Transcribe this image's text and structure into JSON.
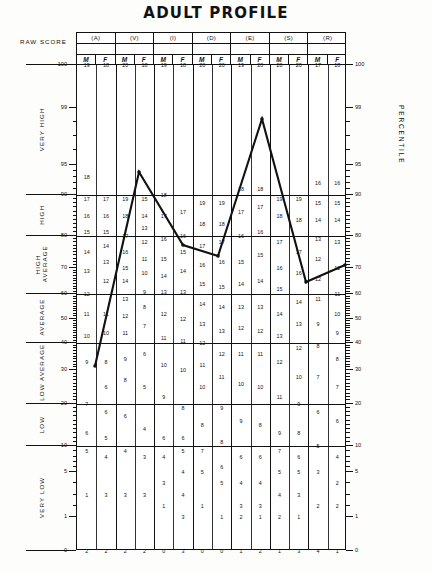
{
  "page": {
    "title": "ADULT PROFILE",
    "raw_score_label": "RAW SCORE",
    "percentile_label": "PERCENTILE"
  },
  "columns": [
    {
      "key": "A",
      "header": "(A)",
      "raw_score": "",
      "sub": [
        "M",
        "F"
      ]
    },
    {
      "key": "V",
      "header": "(V)",
      "raw_score": "",
      "sub": [
        "M",
        "F"
      ]
    },
    {
      "key": "I",
      "header": "(I)",
      "raw_score": "",
      "sub": [
        "M",
        "F"
      ]
    },
    {
      "key": "D",
      "header": "(D)",
      "raw_score": "",
      "sub": [
        "M",
        "F"
      ]
    },
    {
      "key": "E",
      "header": "(E)",
      "raw_score": "",
      "sub": [
        "M",
        "F"
      ]
    },
    {
      "key": "S",
      "header": "(S)",
      "raw_score": "",
      "sub": [
        "M",
        "F"
      ]
    },
    {
      "key": "R",
      "header": "(R)",
      "raw_score": "",
      "sub": [
        "M",
        "F"
      ]
    }
  ],
  "categories": [
    {
      "label": "VERY HIGH",
      "top_pct": 100,
      "bottom_pct": 90
    },
    {
      "label": "HIGH",
      "top_pct": 90,
      "bottom_pct": 80
    },
    {
      "label": "HIGH AVERAGE",
      "top_pct": 80,
      "bottom_pct": 60
    },
    {
      "label": "AVERAGE",
      "top_pct": 60,
      "bottom_pct": 40
    },
    {
      "label": "LOW AVERAGE",
      "top_pct": 40,
      "bottom_pct": 20
    },
    {
      "label": "LOW",
      "top_pct": 20,
      "bottom_pct": 10
    },
    {
      "label": "VERY LOW",
      "top_pct": 10,
      "bottom_pct": 0
    }
  ],
  "axis": {
    "left_ticks": [
      100,
      99,
      95,
      90,
      80,
      70,
      60,
      50,
      40,
      30,
      20,
      10,
      5,
      1,
      0
    ],
    "right_ticks": [
      100,
      99,
      95,
      90,
      80,
      70,
      60,
      50,
      40,
      30,
      20,
      10,
      5,
      1,
      0
    ],
    "min": 0,
    "max": 100
  },
  "chart_data": {
    "type": "line",
    "title": "ADULT PROFILE",
    "xlabel": "",
    "ylabel": "PERCENTILE",
    "ylim": [
      0,
      100
    ],
    "grid": true,
    "legend": "none",
    "categories": [
      "(A)",
      "(V)",
      "(I)",
      "(D)",
      "(E)",
      "(S)",
      "(R)"
    ],
    "series": [
      {
        "name": "profile",
        "x": [
          "(A)",
          "(V)",
          "(I)",
          "(D)",
          "(E)",
          "(S)",
          "(R)"
        ],
        "values": [
          21,
          84,
          57,
          90,
          26,
          26,
          39
        ],
        "points_px": [
          {
            "x": 95,
            "y": 366
          },
          {
            "x": 139,
            "y": 172
          },
          {
            "x": 183,
            "y": 245
          },
          {
            "x": 218,
            "y": 256
          },
          {
            "x": 262,
            "y": 119
          },
          {
            "x": 306,
            "y": 282
          },
          {
            "x": 345,
            "y": 265
          }
        ]
      }
    ]
  },
  "scores": {
    "A": {
      "M": [
        {
          "v": 19,
          "pct": 100
        },
        {
          "v": 18,
          "pct": 93
        },
        {
          "v": 17,
          "pct": 89
        },
        {
          "v": 16,
          "pct": 85
        },
        {
          "v": 15,
          "pct": 81
        },
        {
          "v": 14,
          "pct": 75
        },
        {
          "v": 13,
          "pct": 69
        },
        {
          "v": 12,
          "pct": 60
        },
        {
          "v": 11,
          "pct": 52
        },
        {
          "v": 10,
          "pct": 43
        },
        {
          "v": 9,
          "pct": 33
        },
        {
          "v": 7,
          "pct": 20
        },
        {
          "v": 6,
          "pct": 13
        },
        {
          "v": 5,
          "pct": 9
        },
        {
          "v": 1,
          "pct": 3
        },
        {
          "v": 2,
          "pct": 0
        }
      ],
      "F": [
        {
          "v": 18,
          "pct": 100
        },
        {
          "v": 17,
          "pct": 89
        },
        {
          "v": 16,
          "pct": 85
        },
        {
          "v": 15,
          "pct": 81
        },
        {
          "v": 14,
          "pct": 77
        },
        {
          "v": 13,
          "pct": 72
        },
        {
          "v": 12,
          "pct": 65
        },
        {
          "v": 11,
          "pct": 52
        },
        {
          "v": 10,
          "pct": 44
        },
        {
          "v": 8,
          "pct": 33
        },
        {
          "v": 6,
          "pct": 25
        },
        {
          "v": 6,
          "pct": 18
        },
        {
          "v": 5,
          "pct": 12
        },
        {
          "v": 4,
          "pct": 8
        },
        {
          "v": 3,
          "pct": 3
        },
        {
          "v": 2,
          "pct": 0
        }
      ]
    },
    "V": {
      "M": [
        {
          "v": 20,
          "pct": 100
        },
        {
          "v": 19,
          "pct": 89
        },
        {
          "v": 18,
          "pct": 85
        },
        {
          "v": 17,
          "pct": 80
        },
        {
          "v": 16,
          "pct": 75
        },
        {
          "v": 15,
          "pct": 70
        },
        {
          "v": 14,
          "pct": 65
        },
        {
          "v": 13,
          "pct": 58
        },
        {
          "v": 12,
          "pct": 51
        },
        {
          "v": 11,
          "pct": 44
        },
        {
          "v": 9,
          "pct": 34
        },
        {
          "v": 8,
          "pct": 27
        },
        {
          "v": 6,
          "pct": 17
        },
        {
          "v": 4,
          "pct": 9
        },
        {
          "v": 3,
          "pct": 3
        },
        {
          "v": 2,
          "pct": 0
        }
      ],
      "F": [
        {
          "v": 18,
          "pct": 100
        },
        {
          "v": 15,
          "pct": 89
        },
        {
          "v": 14,
          "pct": 85
        },
        {
          "v": 13,
          "pct": 82
        },
        {
          "v": 12,
          "pct": 78
        },
        {
          "v": 11,
          "pct": 73
        },
        {
          "v": 10,
          "pct": 68
        },
        {
          "v": 9,
          "pct": 61
        },
        {
          "v": 8,
          "pct": 55
        },
        {
          "v": 7,
          "pct": 47
        },
        {
          "v": 6,
          "pct": 36
        },
        {
          "v": 5,
          "pct": 25
        },
        {
          "v": 4,
          "pct": 14
        },
        {
          "v": 3,
          "pct": 8
        },
        {
          "v": 3,
          "pct": 3
        },
        {
          "v": 2,
          "pct": 0
        }
      ]
    },
    "I": {
      "M": [
        {
          "v": 19,
          "pct": 100
        },
        {
          "v": 18,
          "pct": 90
        },
        {
          "v": 17,
          "pct": 85
        },
        {
          "v": 16,
          "pct": 79
        },
        {
          "v": 15,
          "pct": 73
        },
        {
          "v": 14,
          "pct": 67
        },
        {
          "v": 13,
          "pct": 61
        },
        {
          "v": 12,
          "pct": 52
        },
        {
          "v": 11,
          "pct": 42
        },
        {
          "v": 10,
          "pct": 32
        },
        {
          "v": 9,
          "pct": 22
        },
        {
          "v": 6,
          "pct": 12
        },
        {
          "v": 4,
          "pct": 8
        },
        {
          "v": 3,
          "pct": 4
        },
        {
          "v": 1,
          "pct": 2
        },
        {
          "v": 0,
          "pct": 0
        }
      ],
      "F": [
        {
          "v": 18,
          "pct": 100
        },
        {
          "v": 17,
          "pct": 86
        },
        {
          "v": 16,
          "pct": 80
        },
        {
          "v": 15,
          "pct": 75
        },
        {
          "v": 14,
          "pct": 69
        },
        {
          "v": 13,
          "pct": 61
        },
        {
          "v": 12,
          "pct": 50
        },
        {
          "v": 11,
          "pct": 41
        },
        {
          "v": 10,
          "pct": 30
        },
        {
          "v": 8,
          "pct": 19
        },
        {
          "v": 6,
          "pct": 12
        },
        {
          "v": 5,
          "pct": 9
        },
        {
          "v": 4,
          "pct": 5
        },
        {
          "v": 4,
          "pct": 3
        },
        {
          "v": 3,
          "pct": 1
        },
        {
          "v": 3,
          "pct": 0
        }
      ]
    },
    "D": {
      "M": [
        {
          "v": 20,
          "pct": 100
        },
        {
          "v": 19,
          "pct": 88
        },
        {
          "v": 18,
          "pct": 83
        },
        {
          "v": 17,
          "pct": 77
        },
        {
          "v": 16,
          "pct": 71
        },
        {
          "v": 15,
          "pct": 64
        },
        {
          "v": 14,
          "pct": 56
        },
        {
          "v": 13,
          "pct": 48
        },
        {
          "v": 12,
          "pct": 40
        },
        {
          "v": 11,
          "pct": 32
        },
        {
          "v": 10,
          "pct": 25
        },
        {
          "v": 8,
          "pct": 15
        },
        {
          "v": 7,
          "pct": 9
        },
        {
          "v": 5,
          "pct": 5
        },
        {
          "v": 1,
          "pct": 2
        },
        {
          "v": 0,
          "pct": 0
        }
      ],
      "F": [
        {
          "v": 20,
          "pct": 100
        },
        {
          "v": 19,
          "pct": 88
        },
        {
          "v": 18,
          "pct": 83
        },
        {
          "v": 17,
          "pct": 78
        },
        {
          "v": 16,
          "pct": 72
        },
        {
          "v": 15,
          "pct": 63
        },
        {
          "v": 14,
          "pct": 55
        },
        {
          "v": 13,
          "pct": 45
        },
        {
          "v": 12,
          "pct": 36
        },
        {
          "v": 11,
          "pct": 28
        },
        {
          "v": 9,
          "pct": 19
        },
        {
          "v": 8,
          "pct": 11
        },
        {
          "v": 6,
          "pct": 6
        },
        {
          "v": 5,
          "pct": 4
        },
        {
          "v": 1,
          "pct": 1
        },
        {
          "v": 0,
          "pct": 0
        }
      ]
    },
    "E": {
      "M": [
        {
          "v": 19,
          "pct": 100
        },
        {
          "v": 18,
          "pct": 91
        },
        {
          "v": 17,
          "pct": 86
        },
        {
          "v": 16,
          "pct": 80
        },
        {
          "v": 15,
          "pct": 72
        },
        {
          "v": 14,
          "pct": 64
        },
        {
          "v": 13,
          "pct": 55
        },
        {
          "v": 12,
          "pct": 46
        },
        {
          "v": 11,
          "pct": 36
        },
        {
          "v": 10,
          "pct": 26
        },
        {
          "v": 9,
          "pct": 16
        },
        {
          "v": 6,
          "pct": 8
        },
        {
          "v": 4,
          "pct": 4
        },
        {
          "v": 3,
          "pct": 2
        },
        {
          "v": 2,
          "pct": 1
        },
        {
          "v": 1,
          "pct": 0
        }
      ],
      "F": [
        {
          "v": 20,
          "pct": 100
        },
        {
          "v": 18,
          "pct": 91
        },
        {
          "v": 17,
          "pct": 87
        },
        {
          "v": 16,
          "pct": 81
        },
        {
          "v": 15,
          "pct": 74
        },
        {
          "v": 14,
          "pct": 65
        },
        {
          "v": 13,
          "pct": 55
        },
        {
          "v": 12,
          "pct": 45
        },
        {
          "v": 11,
          "pct": 36
        },
        {
          "v": 10,
          "pct": 25
        },
        {
          "v": 8,
          "pct": 15
        },
        {
          "v": 6,
          "pct": 8
        },
        {
          "v": 4,
          "pct": 4
        },
        {
          "v": 3,
          "pct": 2
        },
        {
          "v": 1,
          "pct": 1
        },
        {
          "v": 2,
          "pct": 0
        }
      ]
    },
    "S": {
      "M": [
        {
          "v": 20,
          "pct": 100
        },
        {
          "v": 19,
          "pct": 89
        },
        {
          "v": 18,
          "pct": 85
        },
        {
          "v": 17,
          "pct": 78
        },
        {
          "v": 16,
          "pct": 70
        },
        {
          "v": 15,
          "pct": 62
        },
        {
          "v": 14,
          "pct": 52
        },
        {
          "v": 13,
          "pct": 43
        },
        {
          "v": 12,
          "pct": 33
        },
        {
          "v": 11,
          "pct": 22
        },
        {
          "v": 9,
          "pct": 13
        },
        {
          "v": 7,
          "pct": 9
        },
        {
          "v": 5,
          "pct": 5
        },
        {
          "v": 4,
          "pct": 3
        },
        {
          "v": 2,
          "pct": 1
        },
        {
          "v": 1,
          "pct": 0
        }
      ],
      "F": [
        {
          "v": 20,
          "pct": 100
        },
        {
          "v": 19,
          "pct": 89
        },
        {
          "v": 18,
          "pct": 84
        },
        {
          "v": 17,
          "pct": 75
        },
        {
          "v": 16,
          "pct": 68
        },
        {
          "v": 14,
          "pct": 57
        },
        {
          "v": 13,
          "pct": 48
        },
        {
          "v": 12,
          "pct": 38
        },
        {
          "v": 10,
          "pct": 28
        },
        {
          "v": 9,
          "pct": 20
        },
        {
          "v": 8,
          "pct": 13
        },
        {
          "v": 6,
          "pct": 8
        },
        {
          "v": 5,
          "pct": 5
        },
        {
          "v": 3,
          "pct": 3
        },
        {
          "v": 1,
          "pct": 1
        },
        {
          "v": 3,
          "pct": 0
        }
      ]
    },
    "R": {
      "M": [
        {
          "v": 17,
          "pct": 100
        },
        {
          "v": 16,
          "pct": 92
        },
        {
          "v": 15,
          "pct": 88
        },
        {
          "v": 14,
          "pct": 84
        },
        {
          "v": 13,
          "pct": 79
        },
        {
          "v": 12,
          "pct": 73
        },
        {
          "v": 12,
          "pct": 66
        },
        {
          "v": 11,
          "pct": 58
        },
        {
          "v": 9,
          "pct": 48
        },
        {
          "v": 8,
          "pct": 39
        },
        {
          "v": 7,
          "pct": 28
        },
        {
          "v": 6,
          "pct": 18
        },
        {
          "v": 5,
          "pct": 10
        },
        {
          "v": 3,
          "pct": 5
        },
        {
          "v": 2,
          "pct": 2
        },
        {
          "v": 4,
          "pct": 0
        }
      ],
      "F": [
        {
          "v": 18,
          "pct": 100
        },
        {
          "v": 16,
          "pct": 92
        },
        {
          "v": 15,
          "pct": 88
        },
        {
          "v": 14,
          "pct": 84
        },
        {
          "v": 13,
          "pct": 78
        },
        {
          "v": 12,
          "pct": 70
        },
        {
          "v": 11,
          "pct": 60
        },
        {
          "v": 10,
          "pct": 52
        },
        {
          "v": 9,
          "pct": 44
        },
        {
          "v": 8,
          "pct": 34
        },
        {
          "v": 7,
          "pct": 25
        },
        {
          "v": 6,
          "pct": 16
        },
        {
          "v": 4,
          "pct": 8
        },
        {
          "v": 2,
          "pct": 4
        },
        {
          "v": 2,
          "pct": 2
        },
        {
          "v": 1,
          "pct": 0
        }
      ]
    }
  }
}
